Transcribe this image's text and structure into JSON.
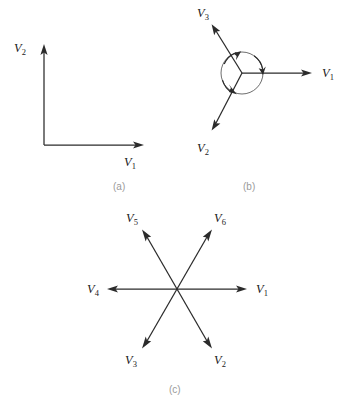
{
  "figure": {
    "background_color": "#ffffff",
    "line_color": "#2b2b2b",
    "circle_color": "#6d6d6d",
    "caption_color": "#9a9a9a",
    "label_color": "#1b1b1b"
  },
  "panels": [
    {
      "id": "a",
      "caption": "(a)",
      "caption_x": 113,
      "caption_y": 190,
      "description": "two orthogonal vectors",
      "origin": {
        "x": 44,
        "y": 145
      },
      "vectors": [
        {
          "name": "V2",
          "symbol": "V",
          "subscript": "2",
          "angle_deg": 90,
          "tip": {
            "x": 44,
            "y": 48
          },
          "label_x": 14,
          "label_y": 52
        },
        {
          "name": "V1",
          "symbol": "V",
          "subscript": "1",
          "angle_deg": 0,
          "tip": {
            "x": 140,
            "y": 145
          },
          "label_x": 124,
          "label_y": 166
        }
      ]
    },
    {
      "id": "b",
      "caption": "(b)",
      "caption_x": 243,
      "caption_y": 190,
      "description": "three vectors 120 degrees apart with rotation circle",
      "origin": {
        "x": 242,
        "y": 73
      },
      "circle_radius": 21,
      "arc_count": 3,
      "vectors": [
        {
          "name": "V1",
          "symbol": "V",
          "subscript": "1",
          "angle_deg": 0,
          "tip": {
            "x": 312,
            "y": 73
          },
          "label_x": 322,
          "label_y": 77
        },
        {
          "name": "V3",
          "symbol": "V",
          "subscript": "3",
          "angle_deg": 120,
          "tip": {
            "x": 212,
            "y": 24
          },
          "label_x": 197,
          "label_y": 17
        },
        {
          "name": "V2",
          "symbol": "V",
          "subscript": "2",
          "angle_deg": 240,
          "tip": {
            "x": 212,
            "y": 130
          },
          "label_x": 197,
          "label_y": 152
        }
      ]
    },
    {
      "id": "c",
      "caption": "(c)",
      "caption_x": 169,
      "caption_y": 393,
      "description": "six vectors 60 degrees apart",
      "origin": {
        "x": 177,
        "y": 289
      },
      "vectors": [
        {
          "name": "V1",
          "symbol": "V",
          "subscript": "1",
          "angle_deg": 0,
          "tip": {
            "x": 247,
            "y": 289
          },
          "label_x": 256,
          "label_y": 293
        },
        {
          "name": "V2",
          "symbol": "V",
          "subscript": "2",
          "angle_deg": 300,
          "tip": {
            "x": 212,
            "y": 348
          },
          "label_x": 214,
          "label_y": 364
        },
        {
          "name": "V3",
          "symbol": "V",
          "subscript": "3",
          "angle_deg": 240,
          "tip": {
            "x": 142,
            "y": 348
          },
          "label_x": 125,
          "label_y": 364
        },
        {
          "name": "V4",
          "symbol": "V",
          "subscript": "4",
          "angle_deg": 180,
          "tip": {
            "x": 107,
            "y": 289
          },
          "label_x": 87,
          "label_y": 293
        },
        {
          "name": "V5",
          "symbol": "V",
          "subscript": "5",
          "angle_deg": 120,
          "tip": {
            "x": 142,
            "y": 230
          },
          "label_x": 126,
          "label_y": 222
        },
        {
          "name": "V6",
          "symbol": "V",
          "subscript": "6",
          "angle_deg": 60,
          "tip": {
            "x": 212,
            "y": 230
          },
          "label_x": 214,
          "label_y": 222
        }
      ]
    }
  ]
}
